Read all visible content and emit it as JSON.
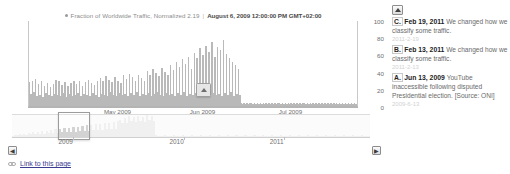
{
  "chart_panel": {
    "legend": {
      "marker": "legend-dot",
      "series_label": "Fraction of Worldwide Traffic, Normalized 2.19",
      "separator": "|",
      "timestamp": "August 6, 2009 12:00:00 PM GMT+02:00"
    },
    "flag": {
      "label": "A"
    },
    "scroll_left": "◀",
    "scroll_right": "▶",
    "link": {
      "text": "Link to this page",
      "icon": "link-icon"
    }
  },
  "annotations": {
    "scroll_up": "▲",
    "items": [
      {
        "key": "C.",
        "date": "Feb 19, 2011",
        "text": "We changed how we classify some traffic.",
        "stamp": "2011-2-19"
      },
      {
        "key": "B.",
        "date": "Feb 13, 2011",
        "text": "We changed how we classify some traffic.",
        "stamp": "2011-2-13"
      },
      {
        "key": "A.",
        "date": "Jun 13, 2009",
        "text": "YouTube inaccessible following disputed Presidential election. [Source: ONI]",
        "stamp": "2009-6-13"
      }
    ]
  },
  "chart_data": {
    "type": "bar",
    "title": "Fraction of Worldwide Traffic, Normalized 2.19",
    "subtitle": "August 6, 2009 12:00:00 PM GMT+02:00",
    "xlabel": "",
    "ylabel": "",
    "ylim": [
      0,
      100
    ],
    "yticks": [
      100,
      80,
      60,
      40,
      20,
      0
    ],
    "grid": false,
    "legend_position": "top-center",
    "xticks": [
      "May 2009",
      "Jun 2009",
      "Jul 2009"
    ],
    "xtick_positions_pct": [
      23,
      49,
      76
    ],
    "annotation_marker": {
      "label": "A",
      "x_pct": 51,
      "note": "Jun 13, 2009 YouTube inaccessible following disputed Presidential election. [Source: ONI]"
    },
    "values": [
      28,
      14,
      30,
      16,
      32,
      12,
      26,
      13,
      29,
      11,
      24,
      15,
      27,
      13,
      22,
      12,
      26,
      14,
      31,
      13,
      29,
      12,
      25,
      15,
      28,
      11,
      23,
      14,
      27,
      12,
      30,
      13,
      26,
      15,
      29,
      12,
      24,
      14,
      28,
      13,
      31,
      12,
      27,
      15,
      25,
      13,
      30,
      11,
      33,
      14,
      29,
      13,
      35,
      12,
      31,
      16,
      28,
      13,
      34,
      12,
      30,
      15,
      27,
      13,
      36,
      14,
      32,
      12,
      38,
      15,
      34,
      13,
      30,
      16,
      37,
      12,
      33,
      14,
      29,
      13,
      41,
      15,
      36,
      12,
      43,
      14,
      39,
      16,
      35,
      13,
      45,
      12,
      40,
      15,
      37,
      13,
      48,
      14,
      42,
      12,
      52,
      15,
      46,
      13,
      55,
      16,
      49,
      12,
      58,
      14,
      44,
      13,
      62,
      15,
      56,
      12,
      68,
      14,
      60,
      16,
      71,
      13,
      64,
      12,
      75,
      15,
      58,
      13,
      70,
      14,
      66,
      12,
      78,
      15,
      61,
      13,
      57,
      16,
      52,
      12,
      48,
      14,
      43,
      13,
      3,
      2,
      4,
      2,
      3,
      2,
      4,
      3,
      2,
      3,
      2,
      4,
      2,
      3,
      2,
      3,
      2,
      3,
      2,
      4,
      2,
      3,
      2,
      3,
      2,
      4,
      3,
      2,
      3,
      2,
      4,
      2,
      3,
      2,
      3,
      2,
      4,
      2,
      3,
      2,
      3,
      2,
      4,
      3,
      2,
      3,
      2,
      4,
      2,
      3,
      2,
      3,
      2,
      4,
      2,
      3,
      2,
      3,
      2,
      4,
      2,
      3,
      2,
      3,
      2,
      4,
      2,
      3,
      2,
      3,
      2,
      4,
      2,
      3,
      2,
      3,
      2,
      4,
      2,
      3
    ],
    "navigator": {
      "xticks": [
        "2009",
        "2010",
        "2011"
      ],
      "xtick_positions_pct": [
        13,
        44,
        72
      ],
      "selection_pct": [
        13,
        22
      ],
      "values": [
        4,
        8,
        6,
        10,
        7,
        12,
        8,
        14,
        9,
        16,
        10,
        18,
        11,
        20,
        12,
        22,
        13,
        24,
        14,
        26,
        15,
        28,
        16,
        30,
        17,
        32,
        18,
        34,
        19,
        36,
        20,
        38,
        21,
        40,
        22,
        42,
        23,
        44,
        24,
        46,
        25,
        48,
        26,
        50,
        27,
        52,
        28,
        54,
        60,
        48,
        66,
        50,
        72,
        54,
        68,
        52,
        74,
        56,
        70,
        53,
        76,
        58,
        72,
        55,
        6,
        3,
        5,
        3,
        6,
        4,
        5,
        3,
        6,
        4,
        5,
        3,
        6,
        4,
        5,
        3,
        6,
        4,
        5,
        3,
        6,
        4,
        5,
        3,
        6,
        4,
        5,
        3,
        6,
        4,
        5,
        3,
        6,
        4,
        5,
        3,
        6,
        4,
        5,
        3,
        6,
        4,
        5,
        3,
        6,
        4,
        5,
        3,
        6,
        4,
        5,
        3,
        6,
        4,
        5,
        3,
        6,
        4,
        5,
        3,
        6,
        4,
        5,
        3,
        6,
        4,
        5,
        3,
        6,
        4,
        5,
        3,
        6,
        4,
        5,
        3,
        6,
        4,
        5,
        3,
        6,
        4,
        5,
        3,
        6,
        4,
        5,
        3,
        6,
        4,
        5,
        3,
        6,
        4,
        5,
        3
      ]
    }
  }
}
